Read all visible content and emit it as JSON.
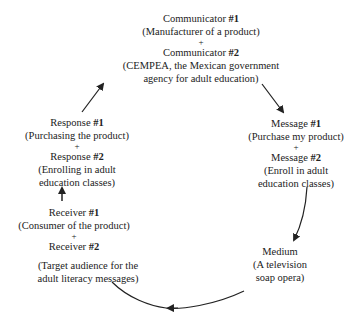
{
  "diagram": {
    "title": "",
    "nodes": {
      "communicator": {
        "label1": "Communicator ",
        "num1": "#1",
        "desc1": "(Manufacturer of a product)",
        "plus": "+",
        "label2": "Communicator ",
        "num2": "#2",
        "desc2a": "(CEMPEA, the Mexican government",
        "desc2b": "agency for adult education)"
      },
      "message": {
        "label1": "Message ",
        "num1": "#1",
        "desc1": "(Purchase my product)",
        "plus": "+",
        "label2": "Message ",
        "num2": "#2",
        "desc2a": "(Enroll in adult",
        "desc2b": "education classes)"
      },
      "medium": {
        "label": "Medium",
        "desc_a": "(A television",
        "desc_b": "soap opera)"
      },
      "receiver": {
        "label1": "Receiver ",
        "num1": "#1",
        "desc1": "(Consumer of the product)",
        "plus": "+",
        "label2": "Receiver ",
        "num2": "#2",
        "desc2a": "(Target audience for the",
        "desc2b": "adult literacy messages)"
      },
      "response": {
        "label1": "Response ",
        "num1": "#1",
        "desc1": "(Purchasing the product)",
        "plus": "+",
        "label2": "Response ",
        "num2": "#2",
        "desc2a": "(Enrolling in adult",
        "desc2b": "education classes)"
      }
    },
    "edges": [
      {
        "from": "communicator",
        "to": "message"
      },
      {
        "from": "message",
        "to": "medium"
      },
      {
        "from": "medium",
        "to": "receiver"
      },
      {
        "from": "receiver",
        "to": "response"
      },
      {
        "from": "response",
        "to": "communicator"
      }
    ],
    "colors": {
      "text": "#222222",
      "arrow": "#222222",
      "background": "#ffffff"
    }
  }
}
